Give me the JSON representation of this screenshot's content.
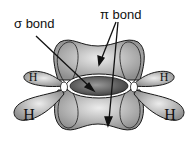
{
  "diagram": {
    "labels": {
      "sigma": "σ bond",
      "pi": "π bond",
      "h_top_left": "H",
      "h_top_right": "H",
      "h_bottom_left": "H",
      "h_bottom_right": "H"
    },
    "colors": {
      "lobe": "#a8a8a8",
      "lobe_light": "#dcdcdc",
      "sigma_core": "#606060",
      "outline": "#1a1a1a",
      "background": "#ffffff"
    }
  }
}
